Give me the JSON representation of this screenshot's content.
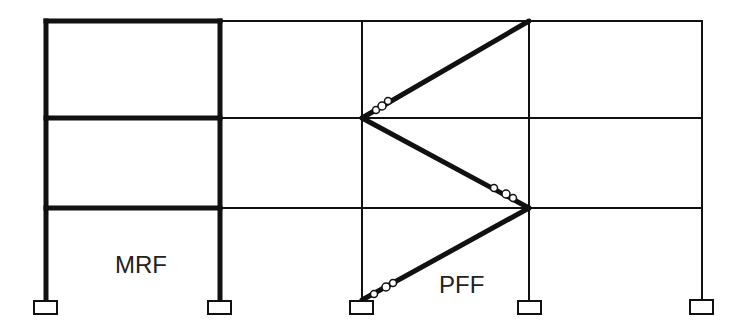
{
  "diagram": {
    "labels": {
      "mrf": "MRF",
      "pff": "PFF"
    },
    "colors": {
      "line": "#111111",
      "background": "#ffffff"
    },
    "columns_x": [
      46,
      220,
      362,
      529,
      702
    ],
    "floors_y": [
      21,
      118,
      208
    ],
    "base_y": 300,
    "mrf_bay": {
      "x1": 46,
      "x2": 220
    },
    "braces": [
      {
        "from": [
          362,
          300
        ],
        "to": [
          529,
          208
        ]
      },
      {
        "from": [
          529,
          208
        ],
        "to": [
          362,
          118
        ]
      },
      {
        "from": [
          362,
          118
        ],
        "to": [
          529,
          21
        ]
      }
    ],
    "fuse_markers": [
      {
        "brace": 0,
        "circles": [
          [
            373,
            294
          ],
          [
            386,
            287
          ],
          [
            393,
            283
          ]
        ]
      },
      {
        "brace": 1,
        "circles": [
          [
            494,
            188
          ],
          [
            507,
            194
          ],
          [
            514,
            198
          ]
        ]
      },
      {
        "brace": 2,
        "circles": [
          [
            376,
            110
          ],
          [
            383,
            106
          ],
          [
            389,
            101
          ]
        ]
      }
    ],
    "supports": 5
  }
}
